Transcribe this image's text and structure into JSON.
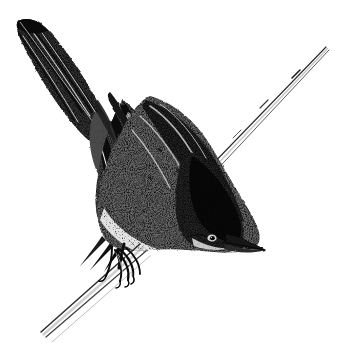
{
  "image": {
    "domain": "Natural-Image",
    "subject": "bird",
    "medium": "pen-and-ink stipple engraving",
    "description": "Monochrome stipple/engraving illustration of a small warbler-like songbird clinging head-down to a slender diagonal reed stem",
    "width": 345,
    "height": 352,
    "background_color": "#ffffff",
    "ink_color": "#1a1a1a",
    "mid_tone_color": "#6b6b6b",
    "light_tone_color": "#b9b9b9"
  },
  "subject": {
    "name": "perched-songbird",
    "pose": "head-down, clinging to vertical reed stem, body angled from upper-left to lower-right",
    "parts": [
      {
        "id": "tail",
        "label": "tail",
        "note": "long dark tail extending to upper-left corner, tip near (17,20)"
      },
      {
        "id": "wing",
        "label": "folded wing",
        "note": "dark barred primaries with pointed tips aimed down-left"
      },
      {
        "id": "scapulars",
        "label": "scapulars",
        "note": "pale stippled shoulder patch"
      },
      {
        "id": "back",
        "label": "mantle / back",
        "note": "mottled mid-grey stipple"
      },
      {
        "id": "breast",
        "label": "breast and belly",
        "note": "pale stippled underside fading to white"
      },
      {
        "id": "head",
        "label": "head",
        "note": "very dark crown and nape, lower-right of body"
      },
      {
        "id": "eye",
        "label": "eye",
        "note": "small dark dot with pale ring near (212,238)"
      },
      {
        "id": "beak",
        "label": "beak",
        "note": "short sharp conical bill pointing right, tip near (266,250)"
      },
      {
        "id": "foot",
        "label": "foot and claws",
        "note": "slender toes gripping the stem near (120,258)"
      }
    ]
  },
  "scene": {
    "elements": [
      {
        "id": "reed-stem",
        "label": "reed stem",
        "note": "slender tapering double-line stalk running diagonally from upper-right (325,48) to lower-left (42,331), passing behind the bird's nape"
      }
    ]
  },
  "geometry": {
    "tail_tip": [
      17,
      20
    ],
    "beak_tip": [
      266,
      250
    ],
    "eye_center": [
      212,
      238
    ],
    "foot_center": [
      121,
      258
    ],
    "stem_top": [
      326,
      47
    ],
    "stem_bottom": [
      41,
      332
    ],
    "body_bounds": [
      15,
      18,
      270,
      290
    ]
  }
}
